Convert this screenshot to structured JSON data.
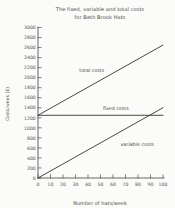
{
  "chart_data": {
    "type": "line",
    "title": "The fixed, variable and total costs for Beth Brook Hats",
    "title_line1": "The fixed, variable and total costs",
    "title_line2": "for Beth Brook Hats",
    "xlabel": "Number of hats/week",
    "ylabel": "Costs/week (£)",
    "xlim": [
      0,
      100
    ],
    "ylim": [
      0,
      3000
    ],
    "x_ticks": [
      0,
      10,
      20,
      30,
      40,
      50,
      60,
      70,
      80,
      90,
      100
    ],
    "y_ticks": [
      0,
      200,
      400,
      600,
      800,
      1000,
      1200,
      1400,
      1600,
      1800,
      2000,
      2200,
      2400,
      2600,
      2800,
      3000
    ],
    "x": [
      0,
      100
    ],
    "grid": false,
    "legend_position": "inline-annotations",
    "series": [
      {
        "name": "total costs",
        "label": "total costs",
        "values": [
          1250,
          2650
        ],
        "label_x": 33,
        "label_y": 2120
      },
      {
        "name": "fixed costs",
        "label": "fixed costs",
        "values": [
          1250,
          1250
        ],
        "label_x": 52,
        "label_y": 1360
      },
      {
        "name": "variable costs",
        "label": "variable costs",
        "values": [
          0,
          1400
        ],
        "label_x": 66,
        "label_y": 640
      }
    ]
  },
  "colors": {
    "line": "#3e3e3b",
    "axis": "#4d4d4a",
    "text": "#4f4f49",
    "background": "#fbfbf9"
  }
}
